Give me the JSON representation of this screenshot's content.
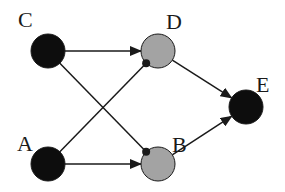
{
  "diagram": {
    "type": "network",
    "colors": {
      "dark_node": "#0d0d0d",
      "grey_node": "#a3a3a3",
      "edge": "#1a1a1a",
      "background": "#ffffff"
    },
    "nodes": [
      {
        "id": "C",
        "label": "C",
        "cx": 48,
        "cy": 51,
        "r": 17,
        "fill": "dark",
        "label_x": 18,
        "label_y": 27
      },
      {
        "id": "D",
        "label": "D",
        "cx": 158,
        "cy": 51,
        "r": 17,
        "fill": "grey",
        "label_x": 166,
        "label_y": 29
      },
      {
        "id": "E",
        "label": "E",
        "cx": 246,
        "cy": 107,
        "r": 17,
        "fill": "dark",
        "label_x": 256,
        "label_y": 92
      },
      {
        "id": "A",
        "label": "A",
        "cx": 48,
        "cy": 164,
        "r": 17,
        "fill": "dark",
        "label_x": 17,
        "label_y": 151
      },
      {
        "id": "B",
        "label": "B",
        "cx": 158,
        "cy": 164,
        "r": 17,
        "fill": "grey",
        "label_x": 172,
        "label_y": 152
      }
    ],
    "edges": [
      {
        "from": "C",
        "to": "D",
        "end": "arrow"
      },
      {
        "from": "C",
        "to": "B",
        "end": "dot"
      },
      {
        "from": "A",
        "to": "D",
        "end": "dot"
      },
      {
        "from": "A",
        "to": "B",
        "end": "arrow"
      },
      {
        "from": "D",
        "to": "E",
        "end": "arrow"
      },
      {
        "from": "B",
        "to": "E",
        "end": "arrow"
      }
    ]
  }
}
